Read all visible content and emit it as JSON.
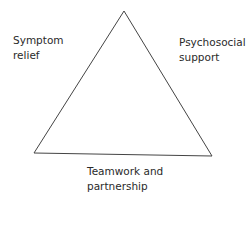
{
  "diagram": {
    "type": "triangle",
    "line_color": "#444444",
    "vertices": {
      "apex": [
        124,
        11
      ],
      "bottom_left": [
        34,
        153
      ],
      "bottom_right": [
        212,
        156
      ]
    },
    "labels": {
      "left": {
        "line1": "Symptom",
        "line2": "relief"
      },
      "right": {
        "line1": "Psychosocial",
        "line2": "support"
      },
      "bottom": {
        "line1": "Teamwork and",
        "line2": "partnership"
      }
    }
  }
}
